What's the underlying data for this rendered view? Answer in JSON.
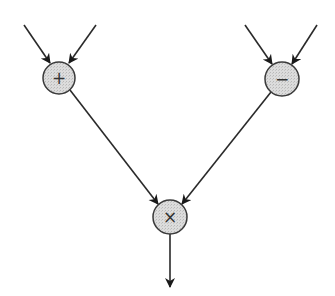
{
  "diagram": {
    "type": "dataflow-graph",
    "colors": {
      "background": "#ffffff",
      "stroke": "#2a2a2a",
      "node_fill": "#d9d9d9",
      "node_stroke": "#3a3a3a"
    },
    "nodes": [
      {
        "id": "add",
        "label": "+",
        "cx": 59,
        "cy": 78,
        "r": 16
      },
      {
        "id": "sub",
        "label": "−",
        "cx": 282,
        "cy": 79,
        "r": 17
      },
      {
        "id": "mul",
        "label": "×",
        "cx": 170,
        "cy": 217,
        "r": 17
      }
    ],
    "edges": [
      {
        "id": "in-add-1",
        "from": [
          24,
          25
        ],
        "to": [
          50,
          63
        ]
      },
      {
        "id": "in-add-2",
        "from": [
          96,
          25
        ],
        "to": [
          69,
          63
        ]
      },
      {
        "id": "in-sub-1",
        "from": [
          245,
          25
        ],
        "to": [
          272,
          64
        ]
      },
      {
        "id": "in-sub-2",
        "from": [
          317,
          25
        ],
        "to": [
          292,
          64
        ]
      },
      {
        "id": "add-mul",
        "from": [
          70,
          90
        ],
        "to": [
          158,
          204
        ]
      },
      {
        "id": "sub-mul",
        "from": [
          271,
          92
        ],
        "to": [
          182,
          204
        ]
      },
      {
        "id": "mul-out",
        "from": [
          170,
          234
        ],
        "to": [
          170,
          287
        ]
      }
    ]
  }
}
